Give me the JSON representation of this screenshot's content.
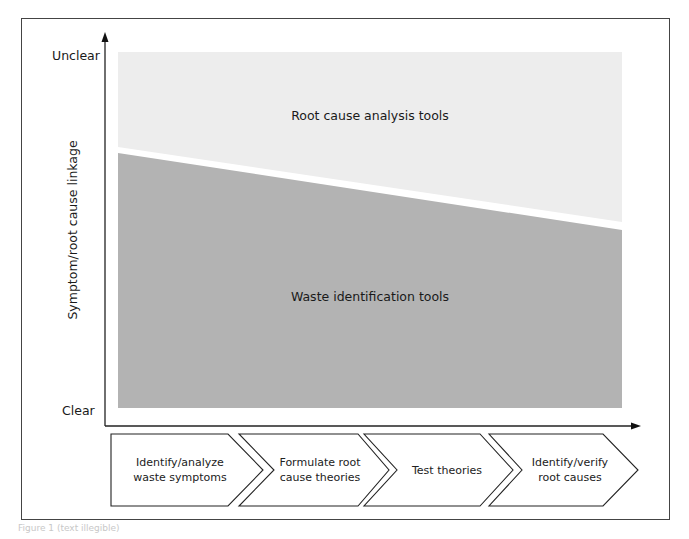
{
  "diagram": {
    "y_axis": {
      "title": "Symptom/root cause linkage",
      "top_label": "Unclear",
      "bottom_label": "Clear"
    },
    "regions": {
      "upper": {
        "label": "Root cause analysis tools",
        "color": "#ededed"
      },
      "lower": {
        "label": "Waste identification tools",
        "color": "#b3b3b3"
      }
    },
    "process_steps": [
      {
        "line1": "Identify/analyze",
        "line2": "waste symptoms"
      },
      {
        "line1": "Formulate root",
        "line2": "cause theories"
      },
      {
        "line1": "Test theories",
        "line2": ""
      },
      {
        "line1": "Identify/verify",
        "line2": "root causes"
      }
    ],
    "caption": "Figure 1 (text illegible)"
  }
}
